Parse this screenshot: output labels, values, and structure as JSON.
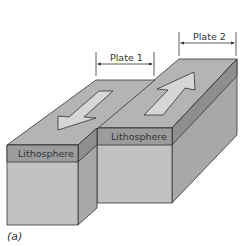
{
  "figure": {
    "caption": "(a)",
    "labels": {
      "plate1": "Plate 1",
      "plate2": "Plate 2",
      "lithosphere_left": "Lithosphere",
      "lithosphere_right": "Lithosphere"
    },
    "colors": {
      "top_face": "#b4b4b4",
      "litho_band": "#9a9a9a",
      "front_face": "#c2c2c2",
      "side_face": "#a8a8a8",
      "side_band": "#8a8a8a",
      "arrow_fill": "#d6d6d6",
      "outline": "#333333"
    },
    "arrows": [
      {
        "plate": "Plate 1",
        "direction": "down-left"
      },
      {
        "plate": "Plate 2",
        "direction": "up-right"
      }
    ]
  }
}
